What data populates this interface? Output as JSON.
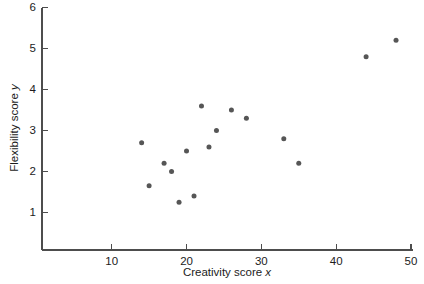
{
  "chart_data": {
    "type": "scatter",
    "title": "",
    "xlabel": "Creativity score x",
    "xlabel_text": "Creativity score",
    "xlabel_var": "x",
    "ylabel": "Flexibility score y",
    "ylabel_text": "Flexibility score",
    "ylabel_var": "y",
    "xlim": [
      2,
      49.5
    ],
    "ylim": [
      0.3,
      6
    ],
    "grid": false,
    "legend": "none",
    "xticks": [
      10,
      20,
      30,
      40,
      50
    ],
    "xtick_labels": [
      "10",
      "20",
      "30",
      "40",
      "50"
    ],
    "yticks": [
      1,
      2,
      3,
      4,
      5,
      6
    ],
    "ytick_labels": [
      "1",
      "2",
      "3",
      "4",
      "5",
      "6"
    ],
    "marker": {
      "shape": "circle",
      "color": "#565656",
      "size_px": 5
    },
    "points": [
      {
        "x": 14,
        "y": 2.7
      },
      {
        "x": 15,
        "y": 1.65
      },
      {
        "x": 17,
        "y": 2.2
      },
      {
        "x": 18,
        "y": 2.0
      },
      {
        "x": 19,
        "y": 1.25
      },
      {
        "x": 20,
        "y": 2.5
      },
      {
        "x": 21,
        "y": 1.4
      },
      {
        "x": 22,
        "y": 3.6
      },
      {
        "x": 23,
        "y": 2.6
      },
      {
        "x": 24,
        "y": 3.0
      },
      {
        "x": 26,
        "y": 3.5
      },
      {
        "x": 28,
        "y": 3.3
      },
      {
        "x": 33,
        "y": 2.8
      },
      {
        "x": 35,
        "y": 2.2
      },
      {
        "x": 44,
        "y": 4.8
      },
      {
        "x": 48,
        "y": 5.2
      }
    ],
    "x_values": [
      14,
      15,
      17,
      18,
      19,
      20,
      21,
      22,
      23,
      24,
      26,
      28,
      33,
      35,
      44,
      48
    ],
    "y_values": [
      2.7,
      1.65,
      2.2,
      2.0,
      1.25,
      2.5,
      1.4,
      3.6,
      2.6,
      3.0,
      3.5,
      3.3,
      2.8,
      2.2,
      4.8,
      5.2
    ],
    "n_points": 16
  },
  "colors": {
    "background": "#ffffff",
    "axis": "#4d4d4d",
    "text": "#1c1c1c",
    "marker": "#565656"
  }
}
